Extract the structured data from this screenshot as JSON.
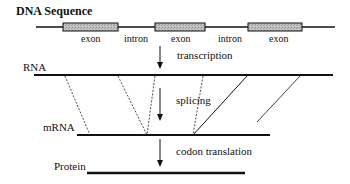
{
  "diagram": {
    "title": "DNA Sequence",
    "dna": {
      "label": "DNA Sequence",
      "segments": [
        {
          "type": "exon",
          "label": "exon"
        },
        {
          "type": "intron",
          "label": "intron"
        },
        {
          "type": "exon",
          "label": "exon"
        },
        {
          "type": "intron",
          "label": "intron"
        },
        {
          "type": "exon",
          "label": "exon"
        }
      ]
    },
    "steps": [
      {
        "id": "transcription",
        "label": "transcription"
      },
      {
        "id": "splicing",
        "label": "splicing"
      },
      {
        "id": "translation",
        "label": "codon translation"
      }
    ],
    "stages": {
      "rna": "RNA",
      "mrna": "mRNA",
      "protein": "Protein"
    },
    "colors": {
      "line": "#111111",
      "exon_fill": "#b8b8b8",
      "background": "#ffffff"
    }
  }
}
